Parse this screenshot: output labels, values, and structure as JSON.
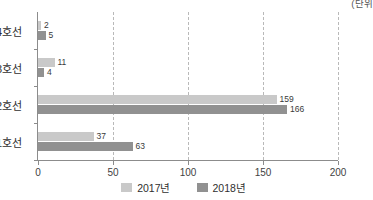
{
  "chart_data": {
    "type": "bar",
    "orientation": "horizontal",
    "title": "",
    "unit_caption": "(단위",
    "categories": [
      "4호선",
      "3호선",
      "2호선",
      "1호선"
    ],
    "series": [
      {
        "name": "2017년",
        "color": "#c9c9c9",
        "values": [
          2,
          11,
          159,
          37
        ]
      },
      {
        "name": "2018년",
        "color": "#919191",
        "values": [
          5,
          4,
          166,
          63
        ]
      }
    ],
    "xlabel": "",
    "ylabel": "",
    "xlim": [
      0,
      200
    ],
    "xticks": [
      0,
      50,
      100,
      150,
      200
    ],
    "xtick_labels": [
      "0",
      "50",
      "100",
      "150",
      "200"
    ],
    "grid": "vertical-dashed",
    "legend_position": "bottom-center",
    "data_labels": {
      "4호선": {
        "2017년": "2",
        "2018년": "5"
      },
      "3호선": {
        "2017년": "11",
        "2018년": "4"
      },
      "2호선": {
        "2017년": "159",
        "2018년": "166"
      },
      "1호선": {
        "2017년": "37",
        "2018년": "63"
      }
    }
  }
}
